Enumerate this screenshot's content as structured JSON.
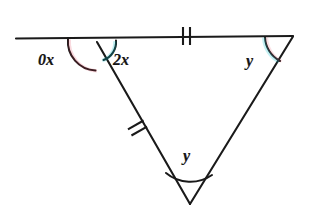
{
  "figure": {
    "kind": "geometry-diagram",
    "background_color": "#ffffff",
    "stroke_color": "#1a1a1a",
    "arc_fringe_colors": [
      "#00c2cc",
      "#e0304a"
    ]
  },
  "labels": {
    "exterior_left": "0x",
    "interior_left": "2x",
    "interior_right": "y",
    "apex_bottom": "y"
  },
  "tick_marks": {
    "top_segment": "2",
    "left_side": "2"
  },
  "points": {
    "line_left_end": [
      16,
      38
    ],
    "top_left_vertex": [
      97,
      42
    ],
    "top_right_vertex": [
      293,
      36
    ],
    "bottom_apex": [
      190,
      204
    ]
  },
  "angle_arcs": [
    {
      "name": "exterior-left-arc",
      "vertex": "top_left_vertex",
      "label": "0x"
    },
    {
      "name": "interior-left-arc",
      "vertex": "top_left_vertex",
      "label": "2x"
    },
    {
      "name": "interior-right-arc",
      "vertex": "top_right_vertex",
      "label": "y"
    },
    {
      "name": "apex-arc",
      "vertex": "bottom_apex",
      "label": "y"
    }
  ]
}
